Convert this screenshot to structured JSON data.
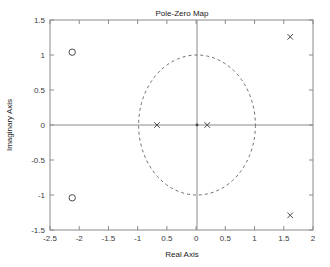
{
  "figure": {
    "title": "Pole-Zero Map",
    "background_color": "#ffffff",
    "axis_color": "#8a8a8a",
    "marker_color": "#4a4a4a"
  },
  "axes": {
    "xlabel": "Real Axis",
    "ylabel": "Imaginary Axis",
    "x_ticks": [
      "-2.5",
      "-2",
      "-1.5",
      "-1",
      "0.5",
      "0",
      "0.5",
      "1",
      "1.5",
      "2"
    ],
    "y_ticks": [
      "1.5",
      "1",
      "0.5",
      "0",
      "-0.5",
      "-1",
      "-1.5"
    ]
  },
  "chart_data": {
    "type": "scatter",
    "title": "Pole-Zero Map",
    "xlabel": "Real Axis",
    "ylabel": "Imaginary Axis",
    "xlim": [
      -2.5,
      2.0
    ],
    "ylim": [
      -1.5,
      1.5
    ],
    "x_ticks": [
      -2.5,
      -2,
      -1.5,
      -1,
      -0.5,
      0,
      0.5,
      1,
      1.5,
      2
    ],
    "y_ticks": [
      -1.5,
      -1,
      -0.5,
      0,
      0.5,
      1,
      1.5
    ],
    "grid": false,
    "legend": "none",
    "series": [
      {
        "name": "Zeros",
        "marker": "circle",
        "points": [
          {
            "x": -2.12,
            "y": 1.04
          },
          {
            "x": -2.12,
            "y": -1.04
          }
        ]
      },
      {
        "name": "Poles",
        "marker": "cross",
        "points": [
          {
            "x": 1.61,
            "y": 1.26
          },
          {
            "x": 1.61,
            "y": -1.29
          },
          {
            "x": -0.67,
            "y": 0.0
          },
          {
            "x": 0.19,
            "y": 0.0
          }
        ]
      }
    ],
    "annotations": [
      {
        "type": "unit-circle",
        "center": [
          0,
          0
        ],
        "radius": 1,
        "style": "dashed"
      },
      {
        "type": "origin-marker",
        "x": 0,
        "y": 0
      }
    ]
  }
}
